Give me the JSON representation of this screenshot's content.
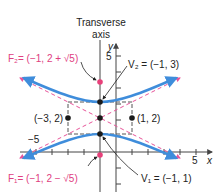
{
  "diagram": {
    "transverse_axis_label": [
      "Transverse",
      "axis"
    ],
    "axes": {
      "x_label": "x",
      "y_label": "y",
      "x_tick_label": "5",
      "x_neg_tick_label": "−5",
      "y_tick_label": "5"
    },
    "points": {
      "center": {
        "coords": [
          -1,
          2
        ]
      },
      "left_box_point": {
        "label": "(−3, 2)",
        "coords": [
          -3,
          2
        ]
      },
      "right_box_point": {
        "label": "(1, 2)",
        "coords": [
          1,
          2
        ]
      },
      "v1": {
        "label": "V₁ = (−1, 1)",
        "coords": [
          -1,
          1
        ]
      },
      "v2": {
        "label": "V₂ = (−1, 3)",
        "coords": [
          -1,
          3
        ]
      },
      "f1": {
        "label": "F₁= (−1, 2 − √5)",
        "coords": [
          -1,
          -0.236
        ]
      },
      "f2": {
        "label": "F₂= (−1, 2 + √5)",
        "coords": [
          -1,
          4.236
        ]
      }
    },
    "colors": {
      "curve": "#3f8ddb",
      "asymptote": "#e8559a",
      "focus": "#e8407a",
      "point": "#1a1a1a",
      "axis": "#444444",
      "box": "#555555"
    }
  }
}
